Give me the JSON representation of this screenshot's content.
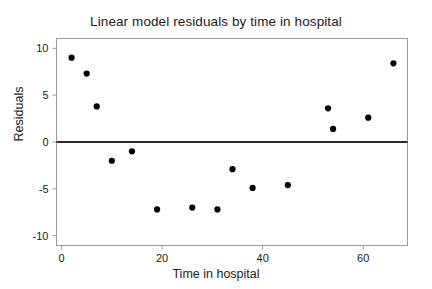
{
  "chart_data": {
    "type": "scatter",
    "title": "Linear model residuals by time in hospital",
    "xlabel": "Time in hospital",
    "ylabel": "Residuals",
    "xlim": [
      -1.0,
      68.8
    ],
    "ylim": [
      -11.05,
      11.05
    ],
    "xticks": [
      0,
      20,
      40,
      60
    ],
    "xtick_labels": [
      "0",
      "20",
      "40",
      "60"
    ],
    "yticks": [
      10,
      5,
      0,
      -5,
      -10
    ],
    "ytick_labels": [
      "10",
      "5",
      "0",
      "-5",
      "-10"
    ],
    "grid": false,
    "legend": null,
    "marker": "filled-circle",
    "marker_color": "#000000",
    "marker_size": 4,
    "frame_color": "#9a9a9a",
    "reference_line": {
      "orientation": "horizontal",
      "y": 0,
      "color": "#2b2b2b",
      "width": 2
    },
    "x": [
      2,
      5,
      7,
      10,
      14,
      19,
      26,
      31,
      34,
      38,
      45,
      53,
      54,
      61,
      66
    ],
    "y": [
      9.0,
      7.3,
      3.8,
      -2.0,
      -1.0,
      -7.2,
      -7.0,
      -7.2,
      -2.9,
      -4.9,
      -4.6,
      3.6,
      1.4,
      2.6,
      8.4
    ],
    "points": [
      {
        "x": 2,
        "y": 9.0
      },
      {
        "x": 5,
        "y": 7.3
      },
      {
        "x": 7,
        "y": 3.8
      },
      {
        "x": 10,
        "y": -2.0
      },
      {
        "x": 14,
        "y": -1.0
      },
      {
        "x": 19,
        "y": -7.2
      },
      {
        "x": 26,
        "y": -7.0
      },
      {
        "x": 31,
        "y": -7.2
      },
      {
        "x": 34,
        "y": -2.9
      },
      {
        "x": 38,
        "y": -4.9
      },
      {
        "x": 45,
        "y": -4.6
      },
      {
        "x": 53,
        "y": 3.6
      },
      {
        "x": 54,
        "y": 1.4
      },
      {
        "x": 61,
        "y": 2.6
      },
      {
        "x": 66,
        "y": 8.4
      }
    ]
  }
}
